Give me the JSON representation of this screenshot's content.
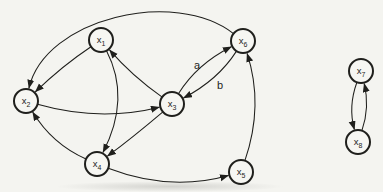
{
  "diagram": {
    "background": "#f4f4f0",
    "ink": "#1f1f1c",
    "node_fill": "#f6f6f2",
    "node_radius": 12,
    "node_stroke_width": 2,
    "edge_stroke_width": 1.05,
    "node_font_size": 9.5,
    "subscript_font_size": 7,
    "edge_label_font_size": 11
  },
  "nodes": [
    {
      "id": "x1",
      "base": "x",
      "sub": "1",
      "x": 101,
      "y": 40
    },
    {
      "id": "x2",
      "base": "x",
      "sub": "2",
      "x": 26,
      "y": 101
    },
    {
      "id": "x3",
      "base": "x",
      "sub": "3",
      "x": 172,
      "y": 104
    },
    {
      "id": "x4",
      "base": "x",
      "sub": "4",
      "x": 97,
      "y": 164
    },
    {
      "id": "x5",
      "base": "x",
      "sub": "5",
      "x": 241,
      "y": 172
    },
    {
      "id": "x6",
      "base": "x",
      "sub": "6",
      "x": 243,
      "y": 41
    },
    {
      "id": "x7",
      "base": "x",
      "sub": "7",
      "x": 361,
      "y": 71
    },
    {
      "id": "x8",
      "base": "x",
      "sub": "8",
      "x": 358,
      "y": 142
    }
  ],
  "edges": [
    {
      "from": "x6",
      "to": "x2",
      "c1": [
        175,
        -12
      ],
      "c2": [
        45,
        18
      ]
    },
    {
      "from": "x1",
      "to": "x2",
      "c1": [
        62,
        66
      ]
    },
    {
      "from": "x3",
      "to": "x1",
      "c1": [
        132,
        76
      ]
    },
    {
      "from": "x2",
      "to": "x3",
      "c1": [
        100,
        122
      ]
    },
    {
      "from": "x3",
      "to": "x6",
      "label": "a",
      "label_pos": [
        197,
        69
      ],
      "c1": [
        197,
        64
      ]
    },
    {
      "from": "x6",
      "to": "x3",
      "label": "b",
      "label_pos": [
        220,
        89
      ],
      "c1": [
        218,
        80
      ]
    },
    {
      "from": "x1",
      "to": "x4",
      "c1": [
        131,
        98
      ]
    },
    {
      "from": "x3",
      "to": "x4",
      "c1": [
        132,
        138
      ]
    },
    {
      "from": "x4",
      "to": "x2",
      "c1": [
        52,
        144
      ]
    },
    {
      "from": "x4",
      "to": "x5",
      "c1": [
        170,
        192
      ]
    },
    {
      "from": "x5",
      "to": "x6",
      "c1": [
        264,
        105
      ]
    },
    {
      "from": "x7",
      "to": "x8",
      "c1": [
        348,
        107
      ]
    },
    {
      "from": "x8",
      "to": "x7",
      "c1": [
        370,
        107
      ]
    }
  ]
}
